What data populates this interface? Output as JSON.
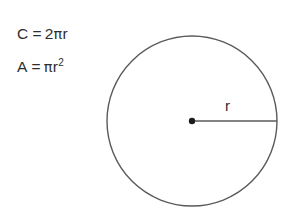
{
  "figure": {
    "background_color": "#ffffff",
    "stroke_color": "#5a5a5a",
    "text_color": "#2e2e2e"
  },
  "formulas": {
    "circumference": {
      "lhs": "C",
      "operator": "=",
      "coefficient": "2",
      "pi": "π",
      "variable": "r",
      "full_text": "C = 2πr"
    },
    "area": {
      "lhs": "A",
      "operator": "=",
      "pi": "π",
      "variable": "r",
      "exponent": "2",
      "full_text": "A = πr²"
    }
  },
  "diagram": {
    "shape": "circle",
    "center_label": "",
    "radius_label": "r",
    "center_point": {
      "x": 192,
      "y": 121
    },
    "radius_px": 85,
    "circle_bounds": {
      "left": 107,
      "top": 36,
      "right": 277,
      "bottom": 206
    },
    "radius_line": {
      "x1": 192,
      "y1": 121,
      "x2": 277,
      "y2": 121
    }
  }
}
